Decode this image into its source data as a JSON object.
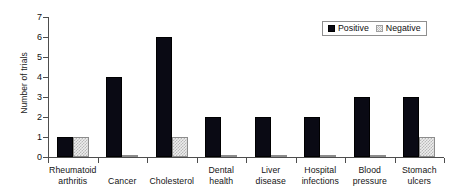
{
  "chart_data": {
    "type": "bar",
    "title": "",
    "xlabel": "",
    "ylabel": "Number of trials",
    "ylim": [
      0,
      7
    ],
    "ytick_labels": [
      "0",
      "1",
      "2",
      "3",
      "4",
      "5",
      "6",
      "7"
    ],
    "grid": false,
    "legend_position": "top-right",
    "categories": [
      "Rheumatoid arthritis",
      "Cancer",
      "Cholesterol",
      "Dental health",
      "Liver disease",
      "Hospital infections",
      "Blood pressure",
      "Stomach ulcers"
    ],
    "category_lines": [
      [
        "Rheumatoid",
        "arthritis"
      ],
      [
        "Cancer",
        ""
      ],
      [
        "Cholesterol",
        ""
      ],
      [
        "Dental",
        "health"
      ],
      [
        "Liver",
        "disease"
      ],
      [
        "Hospital",
        "infections"
      ],
      [
        "Blood",
        "pressure"
      ],
      [
        "Stomach",
        "ulcers"
      ]
    ],
    "series": [
      {
        "name": "Positive",
        "color": "#0a0a14",
        "values": [
          1,
          4,
          6,
          2,
          2,
          2,
          3,
          3
        ]
      },
      {
        "name": "Negative",
        "color": "#ededed",
        "values": [
          1,
          0.1,
          1,
          0.1,
          0.1,
          0.1,
          0.05,
          1
        ]
      }
    ]
  },
  "legend": {
    "entries": [
      {
        "label": "Positive",
        "swatch": "black-square-icon"
      },
      {
        "label": "Negative",
        "swatch": "hatched-square-icon"
      }
    ]
  },
  "axes": {
    "y_title": "Number of trials"
  }
}
